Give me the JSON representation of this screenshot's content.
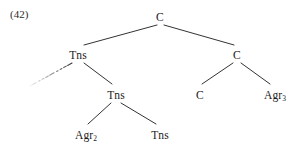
{
  "figure": {
    "example_number": "(42)",
    "background_color": "#ffffff",
    "line_color": "#333333",
    "text_color": "#1a1a1a"
  },
  "tree": {
    "nodes": [
      {
        "id": "root-c",
        "label": "C",
        "subscript": "",
        "x": 160,
        "y": 12
      },
      {
        "id": "tns-left",
        "label": "Tns",
        "subscript": "",
        "x": 78,
        "y": 50
      },
      {
        "id": "c-right",
        "label": "C",
        "subscript": "",
        "x": 237,
        "y": 50
      },
      {
        "id": "tns-mid",
        "label": "Tns",
        "subscript": "",
        "x": 116,
        "y": 90
      },
      {
        "id": "c-leaf",
        "label": "C",
        "subscript": "",
        "x": 200,
        "y": 90
      },
      {
        "id": "agr3-leaf",
        "label": "Agr",
        "subscript": "3",
        "x": 275,
        "y": 90
      },
      {
        "id": "agr2-leaf",
        "label": "Agr",
        "subscript": "2",
        "x": 86,
        "y": 130
      },
      {
        "id": "tns-leaf",
        "label": "Tns",
        "subscript": "",
        "x": 160,
        "y": 130
      }
    ],
    "branches": [
      {
        "id": "root-to-tns-left",
        "x1": 157,
        "y1": 25,
        "x2": 84,
        "y2": 45,
        "style": "solid"
      },
      {
        "id": "root-to-c-right",
        "x1": 164,
        "y1": 25,
        "x2": 234,
        "y2": 45,
        "style": "solid"
      },
      {
        "id": "tns-left-to-trace",
        "x1": 72,
        "y1": 63,
        "x2": 30,
        "y2": 86,
        "style": "fading"
      },
      {
        "id": "tns-left-to-tns",
        "x1": 84,
        "y1": 63,
        "x2": 112,
        "y2": 84,
        "style": "solid"
      },
      {
        "id": "c-right-to-c",
        "x1": 233,
        "y1": 63,
        "x2": 202,
        "y2": 84,
        "style": "solid"
      },
      {
        "id": "c-right-to-agr3",
        "x1": 241,
        "y1": 63,
        "x2": 270,
        "y2": 84,
        "style": "solid"
      },
      {
        "id": "tns-mid-to-agr2",
        "x1": 111,
        "y1": 103,
        "x2": 88,
        "y2": 124,
        "style": "solid"
      },
      {
        "id": "tns-mid-to-tns",
        "x1": 121,
        "y1": 103,
        "x2": 156,
        "y2": 124,
        "style": "solid"
      }
    ]
  }
}
